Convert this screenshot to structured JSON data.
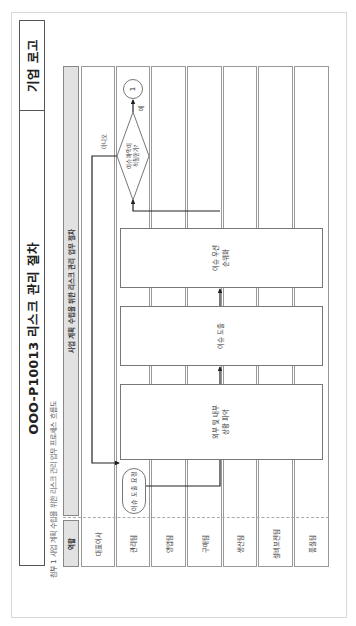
{
  "document": {
    "title": "OOO-P10013 리스크 관리 절차",
    "logo_text": "기업 로고",
    "subtitle": "첨부 1 사업 계획 수립을 위한 리스크 관리 업무 프로세스 흐름도",
    "orientation": "rotated 90° counter-clockwise"
  },
  "flowchart": {
    "header_bar": "사업 계획 수립을 위한 리스크 관리 업무 절차",
    "role_header": "역할",
    "lanes": [
      {
        "label": "대표이사"
      },
      {
        "label": "관리팀"
      },
      {
        "label": "영업팀"
      },
      {
        "label": "구매팀"
      },
      {
        "label": "생산팀"
      },
      {
        "label": "설비보전팀"
      },
      {
        "label": "품질팀"
      }
    ],
    "nodes": {
      "start": "이슈 도출 요청",
      "step1": "외부 및 내부\n상황 파악",
      "step2": "이슈 도출",
      "step3": "이슈 우선\n순위화",
      "decision": "이슈 파악이\n적절한가?",
      "connector": "1"
    },
    "branch_labels": {
      "no": "아니오",
      "yes": "예"
    }
  },
  "colors": {
    "header_fill": "#e2e2e2",
    "line": "#222222",
    "border": "#777777"
  }
}
